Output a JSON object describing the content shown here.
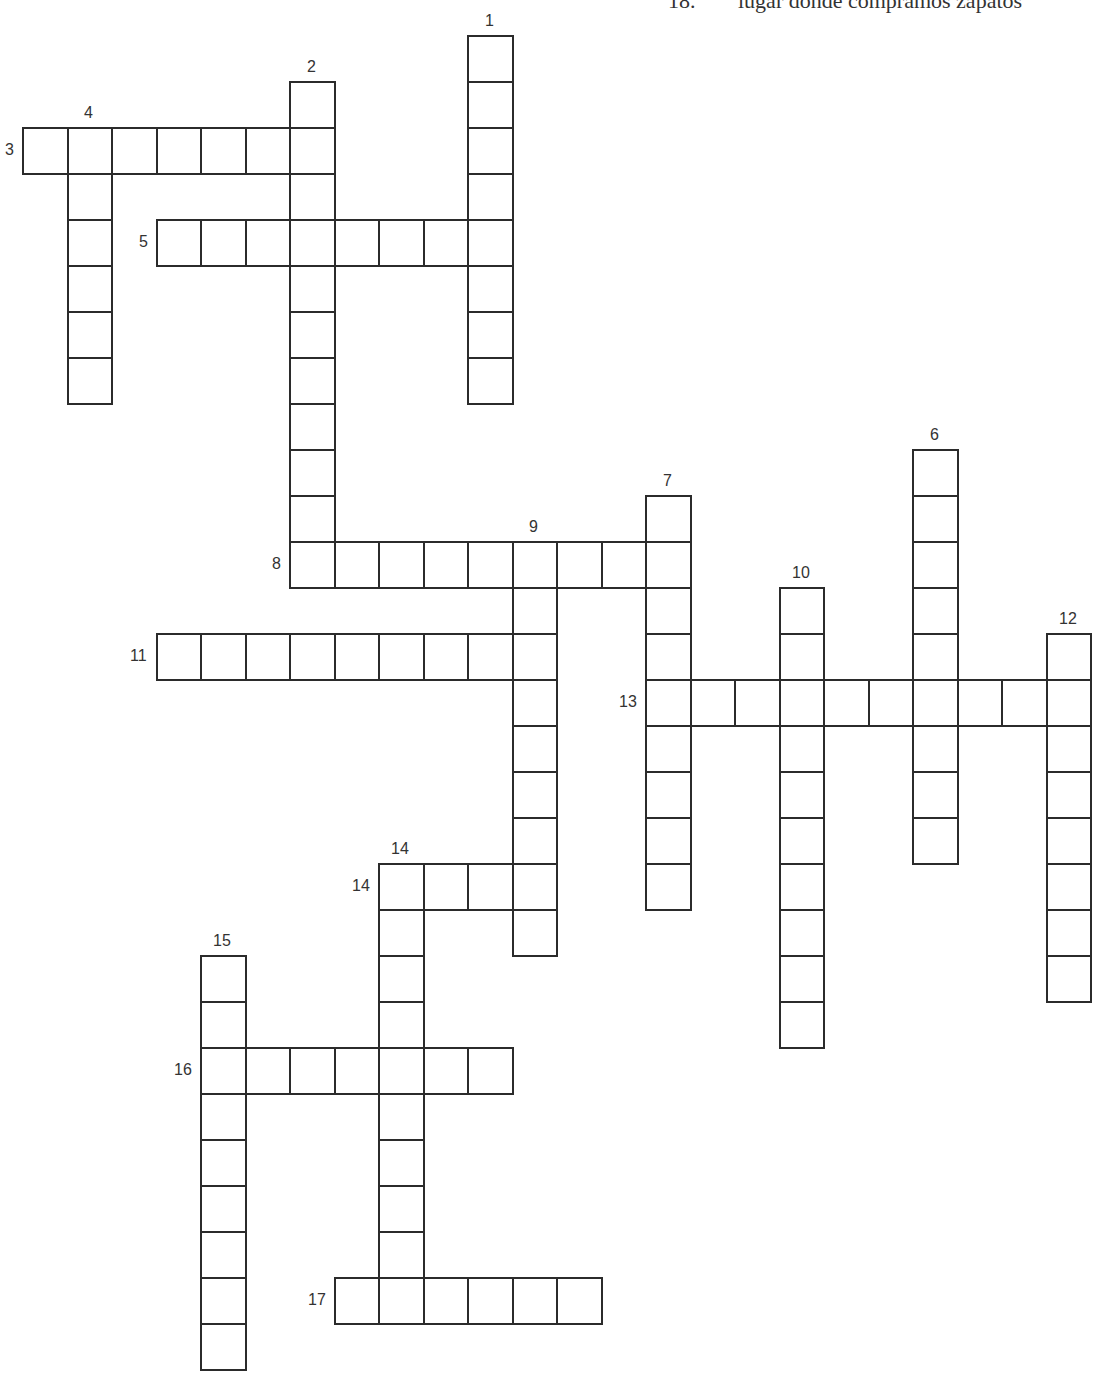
{
  "grid": {
    "origin_x": 22,
    "origin_y": 35,
    "cell_w": 44.5,
    "cell_h": 46,
    "line_color": "#2b2b2b"
  },
  "clue_fragment": {
    "number": "18.",
    "text": "lugar donde compramos zapatos"
  },
  "words": [
    {
      "num": "1",
      "dir": "down",
      "row": 0,
      "col": 10,
      "len": 8,
      "label_pos": "top"
    },
    {
      "num": "2",
      "dir": "down",
      "row": 1,
      "col": 6,
      "len": 11,
      "label_pos": "top"
    },
    {
      "num": "3",
      "dir": "across",
      "row": 2,
      "col": 0,
      "len": 7,
      "label_pos": "left"
    },
    {
      "num": "4",
      "dir": "down",
      "row": 2,
      "col": 1,
      "len": 6,
      "label_pos": "top"
    },
    {
      "num": "5",
      "dir": "across",
      "row": 4,
      "col": 3,
      "len": 8,
      "label_pos": "left"
    },
    {
      "num": "6",
      "dir": "down",
      "row": 9,
      "col": 20,
      "len": 9,
      "label_pos": "top"
    },
    {
      "num": "7",
      "dir": "down",
      "row": 10,
      "col": 14,
      "len": 9,
      "label_pos": "top"
    },
    {
      "num": "8",
      "dir": "across",
      "row": 11,
      "col": 6,
      "len": 9,
      "label_pos": "left"
    },
    {
      "num": "9",
      "dir": "down",
      "row": 11,
      "col": 11,
      "len": 9,
      "label_pos": "top"
    },
    {
      "num": "10",
      "dir": "down",
      "row": 12,
      "col": 17,
      "len": 10,
      "label_pos": "top"
    },
    {
      "num": "11",
      "dir": "across",
      "row": 13,
      "col": 3,
      "len": 9,
      "label_pos": "left"
    },
    {
      "num": "12",
      "dir": "down",
      "row": 13,
      "col": 23,
      "len": 8,
      "label_pos": "top"
    },
    {
      "num": "13",
      "dir": "across",
      "row": 14,
      "col": 14,
      "len": 10,
      "label_pos": "left"
    },
    {
      "num": "14",
      "dir": "across",
      "row": 18,
      "col": 8,
      "len": 4,
      "label_pos": "left"
    },
    {
      "num": "14",
      "dir": "down",
      "row": 18,
      "col": 8,
      "len": 10,
      "label_pos": "top"
    },
    {
      "num": "15",
      "dir": "down",
      "row": 20,
      "col": 4,
      "len": 9,
      "label_pos": "top"
    },
    {
      "num": "16",
      "dir": "across",
      "row": 22,
      "col": 4,
      "len": 7,
      "label_pos": "left"
    },
    {
      "num": "17",
      "dir": "across",
      "row": 27,
      "col": 7,
      "len": 6,
      "label_pos": "left"
    }
  ]
}
